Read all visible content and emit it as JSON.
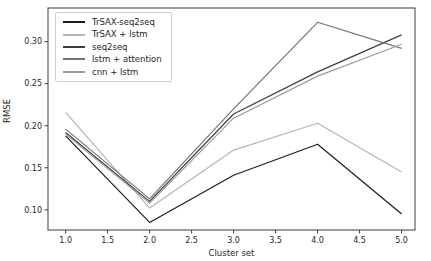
{
  "figure": {
    "background": "#ffffff",
    "spine_color": "#3c3c3c",
    "tick_color": "#3c3c3c",
    "text_color": "#262626"
  },
  "chart_data": {
    "type": "line",
    "title": "",
    "xlabel": "Cluster set",
    "ylabel": "RMSE",
    "x": [
      1,
      2,
      3,
      4,
      5
    ],
    "series": [
      {
        "name": "TrSAX-seq2seq",
        "color": "#1c1c1c",
        "values": [
          0.188,
          0.085,
          0.141,
          0.178,
          0.095
        ]
      },
      {
        "name": "TrSAX + lstm",
        "color": "#b5b5b5",
        "values": [
          0.216,
          0.102,
          0.171,
          0.203,
          0.145
        ]
      },
      {
        "name": "seq2seq",
        "color": "#3d3d3d",
        "values": [
          0.192,
          0.11,
          0.214,
          0.264,
          0.308
        ]
      },
      {
        "name": "lstm + attention",
        "color": "#747474",
        "values": [
          0.196,
          0.113,
          0.22,
          0.323,
          0.292
        ]
      },
      {
        "name": "cnn + lstm",
        "color": "#9b9b9b",
        "values": [
          0.19,
          0.108,
          0.209,
          0.259,
          0.297
        ]
      }
    ],
    "xlim": [
      0.79,
      5.16
    ],
    "ylim": [
      0.076,
      0.34
    ],
    "xticks": [
      1.0,
      1.5,
      2.0,
      2.5,
      3.0,
      3.5,
      4.0,
      4.5,
      5.0
    ],
    "xtick_labels": [
      "1.0",
      "1.5",
      "2.0",
      "2.5",
      "3.0",
      "3.5",
      "4.0",
      "4.5",
      "5.0"
    ],
    "yticks": [
      0.1,
      0.15,
      0.2,
      0.25,
      0.3
    ],
    "ytick_labels": [
      "0.10",
      "0.15",
      "0.20",
      "0.25",
      "0.30"
    ],
    "grid": false,
    "legend_position": "upper left"
  }
}
